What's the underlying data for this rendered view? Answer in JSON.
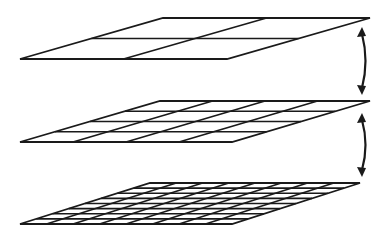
{
  "diagram": {
    "title": "",
    "stroke_color": "#1a1a1a",
    "background": "#ffffff",
    "levels": [
      {
        "name": "coarse",
        "divisions": 2,
        "corners": {
          "tl": [
            163,
            18
          ],
          "tr": [
            370,
            18
          ],
          "br": [
            227,
            59
          ],
          "bl": [
            20,
            59
          ]
        }
      },
      {
        "name": "medium",
        "divisions": 4,
        "corners": {
          "tl": [
            160,
            101
          ],
          "tr": [
            370,
            101
          ],
          "br": [
            232,
            142
          ],
          "bl": [
            20,
            142
          ]
        }
      },
      {
        "name": "fine",
        "divisions": 8,
        "corners": {
          "tl": [
            150,
            183
          ],
          "tr": [
            360,
            183
          ],
          "br": [
            232,
            224
          ],
          "bl": [
            20,
            224
          ]
        }
      }
    ],
    "arrows": [
      {
        "name": "arrow-coarse-medium",
        "type": "double-headed-curved",
        "from": [
          362,
          27
        ],
        "to": [
          362,
          95
        ]
      },
      {
        "name": "arrow-medium-fine",
        "type": "double-headed-curved",
        "from": [
          362,
          113
        ],
        "to": [
          362,
          177
        ]
      }
    ]
  }
}
